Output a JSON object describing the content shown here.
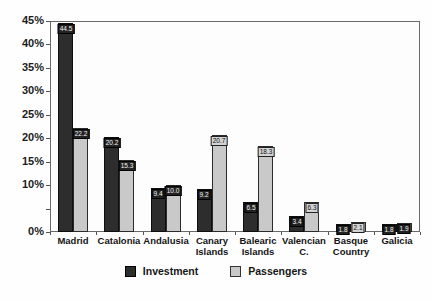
{
  "chart_data": {
    "type": "bar",
    "title": "",
    "categories": [
      "Madrid",
      "Catalonia",
      "Andalusia",
      "Canary Islands",
      "Balearic Islands",
      "Valencian C.",
      "Basque Country",
      "Galicia"
    ],
    "series": [
      {
        "name": "Investment",
        "values": [
          44.5,
          20.2,
          9.4,
          9.2,
          6.5,
          3.4,
          1.8,
          1.8
        ],
        "labels": [
          "44.5",
          "20.2",
          "9.4",
          "9.2",
          "6.5",
          "3.4",
          "1.8",
          "1.8"
        ]
      },
      {
        "name": "Passengers",
        "values": [
          22.2,
          15.3,
          10.0,
          20.7,
          18.3,
          6.3,
          2.1,
          1.9
        ],
        "labels": [
          "22.2",
          "15.3",
          "10.0",
          "20.7",
          "18.3",
          "6.3",
          "2.1",
          "1.9"
        ],
        "label_dark_box": [
          true,
          true,
          true,
          false,
          false,
          false,
          false,
          true
        ]
      }
    ],
    "ylim": [
      0,
      45
    ],
    "y_tick_step": 5,
    "y_tick_labels": [
      "0%",
      "",
      "10%",
      "15%",
      "20%",
      "25%",
      "30%",
      "35%",
      "40%",
      "45%"
    ],
    "grid": false,
    "legend_position": "bottom"
  },
  "colors": {
    "investment": "#2d2d2d",
    "passengers": "#c9c9c9",
    "axis": "#555555",
    "background": "#fefefe"
  },
  "legend": {
    "investment_label": "Investment",
    "passengers_label": "Passengers"
  }
}
